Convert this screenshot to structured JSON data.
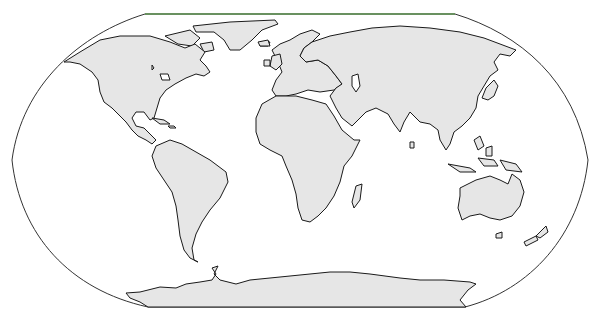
{
  "map": {
    "type": "world-outline-map",
    "projection": "pseudo-cylindrical (Robinson/Winkel-style)",
    "colors": {
      "background": "#ffffff",
      "land_fill": "#e6e6e6",
      "coastline": "#1a1a1a",
      "frame": "#333333",
      "frame_top_edge": "#5a8f4e"
    },
    "regions": [
      {
        "name": "North America"
      },
      {
        "name": "Greenland"
      },
      {
        "name": "South America"
      },
      {
        "name": "Europe"
      },
      {
        "name": "Africa"
      },
      {
        "name": "Madagascar"
      },
      {
        "name": "Asia"
      },
      {
        "name": "Japan"
      },
      {
        "name": "Southeast Asia"
      },
      {
        "name": "Australia"
      },
      {
        "name": "New Zealand"
      },
      {
        "name": "Antarctica"
      }
    ],
    "labels": []
  }
}
